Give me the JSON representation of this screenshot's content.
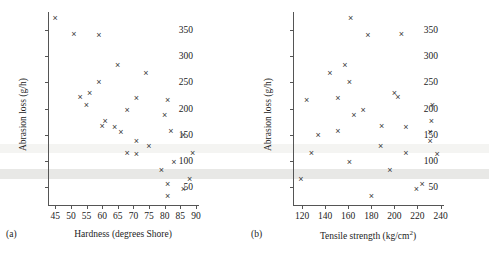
{
  "figure": {
    "background_color": "#ffffff",
    "marker_color": "#3a3a3a",
    "axis_color": "#555555",
    "marker_symbol": "x"
  },
  "scan_artifacts": [
    {
      "name": "light-band",
      "top": 144,
      "height": 9,
      "color": "#f4f4f2"
    },
    {
      "name": "dark-band",
      "top": 169,
      "height": 10,
      "color": "#e8e8e6"
    }
  ],
  "panels": [
    {
      "tag": "(a)",
      "ylabel": "Abrasion loss (g/h)",
      "xlabel_main": "Hardness (degrees Shore)"
    },
    {
      "tag": "(b)",
      "ylabel": "Abrasion loss (g/h)",
      "xlabel_main": "Tensile strength (kg/cm",
      "xlabel_sup": "2",
      "xlabel_tail": ")"
    }
  ],
  "chart_data": [
    {
      "type": "scatter",
      "panel": "(a)",
      "title": "",
      "xlabel": "Hardness (degrees Shore)",
      "ylabel": "Abrasion loss (g/h)",
      "xlim": [
        43,
        91
      ],
      "ylim": [
        15,
        385
      ],
      "xticks": [
        45,
        50,
        55,
        60,
        65,
        70,
        75,
        80,
        85,
        90
      ],
      "yticks": [
        50,
        100,
        150,
        200,
        250,
        300,
        350
      ],
      "grid": false,
      "legend": null,
      "x": [
        45,
        55,
        61,
        66,
        71,
        71,
        81,
        86,
        53,
        60,
        64,
        68,
        79,
        81,
        56,
        68,
        75,
        83,
        88,
        59,
        71,
        80,
        82,
        89,
        51,
        59,
        65,
        74,
        81,
        86
      ],
      "y": [
        372,
        206,
        175,
        154,
        136,
        112,
        55,
        45,
        221,
        166,
        164,
        113,
        82,
        32,
        228,
        196,
        128,
        97,
        64,
        249,
        219,
        186,
        155,
        114,
        341,
        340,
        283,
        267,
        215,
        148
      ]
    },
    {
      "type": "scatter",
      "panel": "(b)",
      "title": "",
      "xlabel": "Tensile strength (kg/cm^2)",
      "ylabel": "Abrasion loss (g/h)",
      "xlim": [
        113,
        243
      ],
      "ylim": [
        15,
        385
      ],
      "xticks": [
        120,
        140,
        160,
        180,
        200,
        220,
        240
      ],
      "yticks": [
        50,
        100,
        150,
        200,
        250,
        300,
        350
      ],
      "grid": false,
      "legend": null,
      "x": [
        162,
        233,
        232,
        231,
        231,
        237,
        224,
        219,
        203,
        189,
        210,
        210,
        196,
        180,
        200,
        173,
        188,
        161,
        119,
        161,
        151,
        165,
        151,
        128,
        206,
        177,
        157,
        144,
        124,
        134
      ],
      "y": [
        372,
        206,
        175,
        154,
        136,
        112,
        55,
        45,
        221,
        166,
        164,
        113,
        82,
        32,
        228,
        196,
        128,
        97,
        64,
        249,
        219,
        186,
        155,
        114,
        341,
        340,
        283,
        267,
        215,
        148
      ]
    }
  ]
}
